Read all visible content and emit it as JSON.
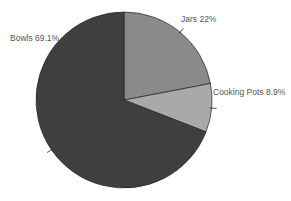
{
  "chart_data": {
    "type": "pie",
    "title": "",
    "categories": [
      "Jars",
      "Cooking Pots",
      "Bowls"
    ],
    "values": [
      22,
      8.9,
      69.1
    ],
    "labels": [
      "Jars 22%",
      "Cooking Pots 8.9%",
      "Bowls 69.1%"
    ],
    "colors": [
      "#8a8a8a",
      "#a9a9a9",
      "#3f3f3f"
    ],
    "start_angle_deg": 0,
    "direction": "clockwise",
    "legend": "none"
  }
}
